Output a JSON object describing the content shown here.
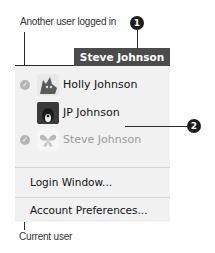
{
  "annotations": {
    "another_user_caption": "Another user logged in",
    "current_user_caption": "Current user",
    "callout_1": "1",
    "callout_2": "2"
  },
  "menu": {
    "header_title": "Steve Johnson",
    "users": [
      {
        "name": "Holly Johnson",
        "logged_in": true,
        "enabled": true,
        "avatar_icon": "cat-avatar-icon"
      },
      {
        "name": "JP Johnson",
        "logged_in": false,
        "enabled": true,
        "avatar_icon": "dog-avatar-icon"
      },
      {
        "name": "Steve Johnson",
        "logged_in": true,
        "enabled": false,
        "avatar_icon": "butterfly-avatar-icon"
      }
    ],
    "items": [
      {
        "label": "Login Window..."
      },
      {
        "label": "Account Preferences..."
      }
    ],
    "check_glyph": "✓"
  },
  "colors": {
    "header_bg": "#4b4b4b",
    "menu_bg": "#f1f1f1",
    "callout_bg": "#1e1e1e",
    "check_bg": "#b5b5b5",
    "disabled_text": "#9a9a9a"
  }
}
